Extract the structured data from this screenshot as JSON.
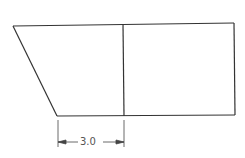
{
  "drawing": {
    "title": "Trapezoid prism side view with dimension",
    "line_color": "#333333",
    "dimension": {
      "label": "3.0",
      "from_x": 57,
      "to_x": 124
    }
  }
}
